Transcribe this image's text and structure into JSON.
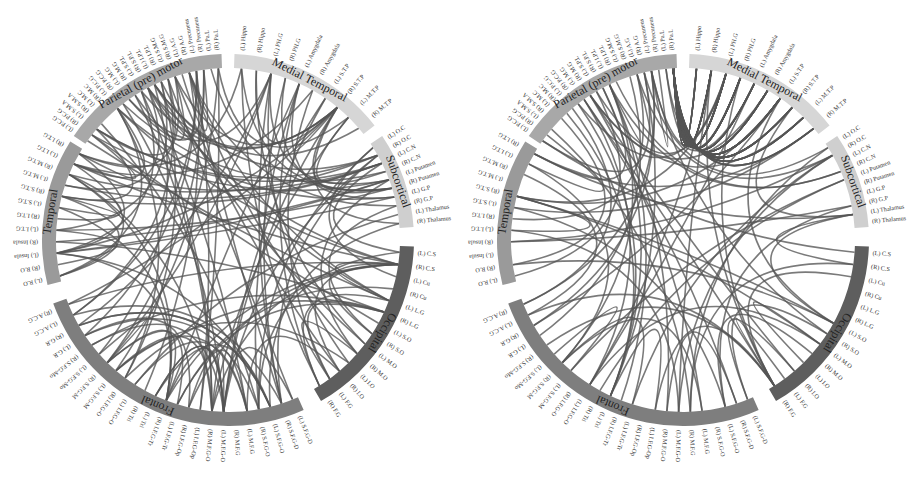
{
  "figure": {
    "type": "chord-diagram-pair",
    "panels": [
      "left",
      "right"
    ]
  },
  "groups": [
    {
      "name": "Medial Temporal",
      "color": "#d6d6d6",
      "labels": [
        "(L) Hippo",
        "(R) Hippo",
        "(L) PH.G",
        "(R) PH.G",
        "(L) Amygdala",
        "(R) Amygdala",
        "(L) S.T.P",
        "(R) S.T.P",
        "(L) M.T.P",
        "(R) M.T.P"
      ]
    },
    {
      "name": "Subcortical",
      "color": "#cfcfcf",
      "labels": [
        "(L) O.C",
        "(R) O.C",
        "(L) C.N",
        "(R) C.N",
        "(L) Putamen",
        "(R) Putamen",
        "(L) G.P",
        "(R) G.P",
        "(L) Thalamus",
        "(R) Thalamus"
      ]
    },
    {
      "name": "Occipital",
      "color": "#5e5e5e",
      "labels": [
        "(L) C.S",
        "(R) C.S",
        "(L) Cu",
        "(R) Cu",
        "(L) L.G",
        "(R) L.G",
        "(L) S.O",
        "(R) S.O",
        "(L) M.O",
        "(R) M.O",
        "(L) I.O",
        "(R) I.O",
        "(L) F.G",
        "(R) F.G"
      ]
    },
    {
      "name": "Frontal",
      "color": "#7e7e7e",
      "labels": [
        "(L) S.F.G-D",
        "(R) S.F.G-D",
        "(L) S.F.G-O",
        "(R) S.F.G-O",
        "(L) M.F.G",
        "(R) M.F.G",
        "(L) M.F.G-O",
        "(R) M.F.G-O",
        "(L) I.F.G-Op",
        "(R) I.F.G-Op",
        "(L) I.F.G-Tr",
        "(R) I.F.G-Tr",
        "(L) Tri",
        "(R) Tri",
        "(L) I.F.G-O",
        "(R) I.F.G-O",
        "(L) S.F.G-M",
        "(R) S.F.G-M",
        "(L) S.F.G-Mo",
        "(R) S.F.G-Mo",
        "(L) G.R",
        "(R) G.R",
        "(L) A.C.G",
        "(R) A.C.G"
      ]
    },
    {
      "name": "Temporal",
      "color": "#9a9a9a",
      "labels": [
        "(L) R.O",
        "(R) R.O",
        "(L) Insula",
        "(R) Insula",
        "(L) I.T.G",
        "(R) I.T.G",
        "(L) S.T.G",
        "(R) S.T.G",
        "(L) M.T.G",
        "(R) M.T.G",
        "(L) I.T.G",
        "(R) I.T.G"
      ]
    },
    {
      "name": "Parietal (pre) motor",
      "color": "#a8a8a8",
      "labels": [
        "(L) P.C.G",
        "(R) P.C.G",
        "(L) S.M.A",
        "(R) S.M.A",
        "(L) M.C",
        "(R) M.C",
        "(L) P.C.G",
        "(R) P.C.G",
        "(L) M.G",
        "(R) M.G",
        "(L) S.P.L",
        "(R) S.P.L",
        "(L) I.P.L",
        "(R) I.P.L",
        "(L) S.M.G",
        "(R) S.M.G",
        "(L) A.G",
        "(R) A.G",
        "(L) Precuneus",
        "(R) Precuneus",
        "(L) Pa.L",
        "(R) Pa.L"
      ]
    }
  ],
  "layout": {
    "group_spans_deg": [
      {
        "name": "Medial Temporal",
        "start": 2,
        "end": 52
      },
      {
        "name": "Subcortical",
        "start": 56,
        "end": 86
      },
      {
        "name": "Occipital",
        "start": 92,
        "end": 150
      },
      {
        "name": "Frontal",
        "start": 156,
        "end": 250
      },
      {
        "name": "Temporal",
        "start": 256,
        "end": 302
      },
      {
        "name": "Parietal (pre) motor",
        "start": 304,
        "end": 358
      }
    ]
  },
  "panels": {
    "left": {
      "seed": 7,
      "chord_count": 150,
      "pattern": "distributed"
    },
    "right": {
      "seed": 23,
      "chord_count": 170,
      "pattern": "medial-temporal-parietal-hub"
    }
  }
}
